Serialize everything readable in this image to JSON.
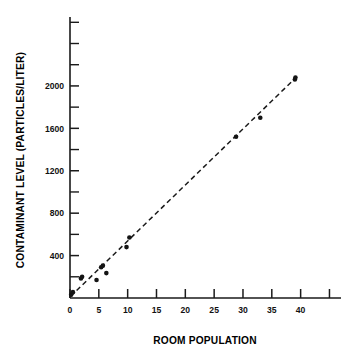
{
  "chart_data": {
    "type": "scatter",
    "title": "",
    "xlabel": "ROOM POPULATION",
    "ylabel": "CONTAMINANT LEVEL (PARTICLES/LITER)",
    "xlim": [
      0,
      47
    ],
    "ylim": [
      0,
      2650
    ],
    "grid": false,
    "legend": null,
    "x_ticks": [
      0,
      5,
      10,
      15,
      20,
      25,
      30,
      35,
      40,
      45
    ],
    "x_tick_labels": [
      "0",
      "5",
      "10",
      "15",
      "20",
      "25",
      "30",
      "35",
      "40",
      ""
    ],
    "y_ticks_major": [
      400,
      800,
      1200,
      1600,
      2000
    ],
    "y_tick_labels": [
      "400",
      "800",
      "1200",
      "1600",
      "2000"
    ],
    "y_ticks_minor": [
      200,
      600,
      1000,
      1400,
      1800,
      2200,
      2400,
      2600
    ],
    "points": [
      {
        "x": 0.2,
        "y": 30
      },
      {
        "x": 0.5,
        "y": 55
      },
      {
        "x": 1.9,
        "y": 185
      },
      {
        "x": 2.1,
        "y": 200
      },
      {
        "x": 4.6,
        "y": 170
      },
      {
        "x": 5.4,
        "y": 290
      },
      {
        "x": 5.7,
        "y": 305
      },
      {
        "x": 6.3,
        "y": 235
      },
      {
        "x": 9.8,
        "y": 480
      },
      {
        "x": 10.3,
        "y": 570
      },
      {
        "x": 28.8,
        "y": 1520
      },
      {
        "x": 33.0,
        "y": 1700
      },
      {
        "x": 39.0,
        "y": 2060
      },
      {
        "x": 39.1,
        "y": 2080
      }
    ],
    "fit_line": {
      "style": "dashed",
      "x_start": 0.1,
      "y_start": 15,
      "x_end": 39.2,
      "y_end": 2080
    }
  },
  "colors": {
    "axis": "#1a1a1a",
    "marker": "#141414",
    "fit": "#1a1a1a",
    "background": "#ffffff"
  }
}
